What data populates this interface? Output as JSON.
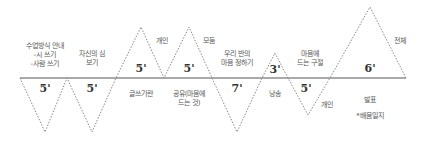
{
  "diagram": {
    "line_color": "#888888",
    "baseline_color": "#555555",
    "segments": [
      {
        "duration": "5'",
        "direction": "down",
        "label": "수업방식 안내\n-시 쓰기\n-사람 쓰기"
      },
      {
        "duration": "5'",
        "direction": "down",
        "label": "자신의 심\n보기"
      },
      {
        "duration": "5'",
        "direction": "up",
        "label": "글쓰기란",
        "side_label": "개인"
      },
      {
        "duration": "5'",
        "direction": "up",
        "label": "공유(마음에\n드는 것)",
        "side_label": "모둠"
      },
      {
        "duration": "7'",
        "direction": "down",
        "label": "우리 반의\n마음 정하기"
      },
      {
        "duration": "3'",
        "direction": "up",
        "label": "낭송"
      },
      {
        "duration": "5'",
        "direction": "down",
        "label": "마음에\n드는 구절",
        "side_label": "개인"
      },
      {
        "duration": "6'",
        "direction": "up",
        "label": "발표\n*배움일지",
        "side_label": "전체"
      }
    ]
  }
}
